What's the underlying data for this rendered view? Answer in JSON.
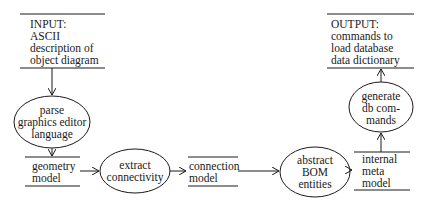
{
  "diagram": {
    "type": "data-flow",
    "stores": {
      "input": {
        "lines": [
          "INPUT:",
          "ASCII",
          "description of",
          "object diagram"
        ]
      },
      "geometry": {
        "lines": [
          "geometry",
          "model"
        ]
      },
      "connection": {
        "lines": [
          "connection",
          "model"
        ]
      },
      "meta": {
        "lines": [
          "internal",
          "meta",
          "model"
        ]
      },
      "output": {
        "lines": [
          "OUTPUT:",
          "commands to",
          "load database",
          "data dictionary"
        ]
      }
    },
    "processes": {
      "parse": {
        "lines": [
          "parse",
          "graphics editor",
          "language"
        ]
      },
      "extract": {
        "lines": [
          "extract",
          "connectivity"
        ]
      },
      "abstract": {
        "lines": [
          "abstract",
          "BOM",
          "entities"
        ]
      },
      "generate": {
        "lines": [
          "generate",
          "db com-",
          "mands"
        ]
      }
    },
    "flows": [
      [
        "input",
        "parse"
      ],
      [
        "parse",
        "geometry"
      ],
      [
        "geometry",
        "extract"
      ],
      [
        "extract",
        "connection"
      ],
      [
        "connection",
        "abstract"
      ],
      [
        "abstract",
        "meta"
      ],
      [
        "meta",
        "generate"
      ],
      [
        "generate",
        "output"
      ]
    ]
  }
}
